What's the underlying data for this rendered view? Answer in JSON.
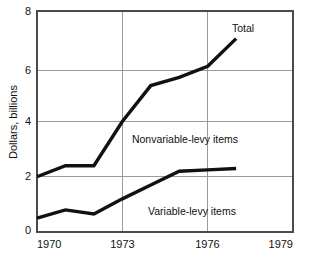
{
  "chart_data": {
    "type": "line",
    "title": "",
    "xlabel": "",
    "ylabel": "Dollars, billions",
    "xlim": [
      1970,
      1979
    ],
    "ylim": [
      0,
      8
    ],
    "grid": true,
    "legend_position": "inline-annotations",
    "x_ticks": [
      "1970",
      "1973",
      "1976",
      "1979"
    ],
    "x_tick_values": [
      1970,
      1973,
      1976,
      1979
    ],
    "y_ticks": [
      "0",
      "2",
      "4",
      "6",
      "8"
    ],
    "y_tick_values": [
      0,
      2,
      4,
      6,
      8
    ],
    "gridlines_vertical_at": [
      1973,
      1976
    ],
    "gridlines_horizontal_at": [
      2,
      4,
      6
    ],
    "series": [
      {
        "name": "Total",
        "label": "Total",
        "label_x": 1977.0,
        "label_y": 7.55,
        "x": [
          1970,
          1971,
          1972,
          1973,
          1974,
          1975,
          1976,
          1977
        ],
        "values": [
          2.0,
          2.4,
          2.4,
          4.0,
          5.3,
          5.6,
          6.0,
          7.0
        ]
      },
      {
        "name": "Variable-levy items",
        "label": "Variable-levy items",
        "label_x": 1974.7,
        "label_y": 0.75,
        "x": [
          1970,
          1971,
          1972,
          1973,
          1974,
          1975,
          1976,
          1977
        ],
        "values": [
          0.5,
          0.8,
          0.65,
          1.2,
          1.7,
          2.2,
          2.25,
          2.3
        ]
      }
    ],
    "annotations": [
      {
        "name": "nonvariable-levy-items",
        "text": "Nonvariable-levy items",
        "x": 1974.0,
        "y": 3.35
      }
    ],
    "colors": {
      "line": "#111111",
      "grid": "#9a9a9a",
      "frame": "#4a4a4a",
      "background": "#ffffff",
      "text": "#111111"
    }
  }
}
